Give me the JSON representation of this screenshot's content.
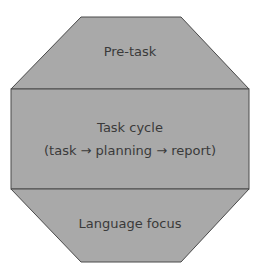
{
  "diagram": {
    "type": "octagon-framework",
    "fill_color": "#a9a9a9",
    "stroke_color": "#4a4a4a",
    "sections": [
      {
        "title": "Pre-task",
        "subtitle": ""
      },
      {
        "title": "Task cycle",
        "subtitle": "(task → planning → report)"
      },
      {
        "title": "Language focus",
        "subtitle": ""
      }
    ]
  }
}
